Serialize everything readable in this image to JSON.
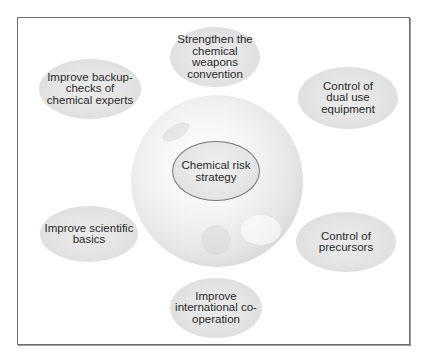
{
  "diagram": {
    "center": {
      "label": "Chemical risk\nstrategy"
    },
    "nodes": [
      {
        "id": "top",
        "label": "Strengthen the\nchemical\nweapons\nconvention"
      },
      {
        "id": "top-left",
        "label": "Improve backup-\nchecks of\nchemical experts"
      },
      {
        "id": "top-right",
        "label": "Control of\ndual use\nequipment"
      },
      {
        "id": "bottom-left",
        "label": "Improve scientific\nbasics"
      },
      {
        "id": "bottom-right",
        "label": "Control of\nprecursors"
      },
      {
        "id": "bottom",
        "label": "Improve\ninternational co-\noperation"
      }
    ],
    "background_image": "globe"
  }
}
